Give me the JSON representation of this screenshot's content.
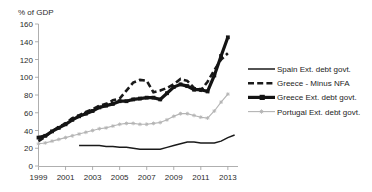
{
  "chart_data": {
    "type": "line",
    "title": "",
    "ylabel": "% of GDP",
    "xlabel": "",
    "ylim": [
      0,
      160
    ],
    "ytick_step": 20,
    "yticks": [
      0,
      20,
      40,
      60,
      80,
      100,
      120,
      140,
      160
    ],
    "xlim": [
      1999,
      2013.75
    ],
    "xticks": [
      1999,
      2001,
      2003,
      2005,
      2007,
      2009,
      2011,
      2013
    ],
    "xtick_labels": [
      "1999",
      "2001",
      "2003",
      "2005",
      "2007",
      "2009",
      "2011",
      "2013"
    ],
    "grid": false,
    "legend_position": "right",
    "series": [
      {
        "name": "Spain Ext. debt govt.",
        "key": "spain",
        "color": "#1a1a1a",
        "style": "solid-thin",
        "marker": "none",
        "x": [
          2002.0,
          2002.5,
          2003.0,
          2003.5,
          2004.0,
          2004.5,
          2005.0,
          2005.5,
          2006.0,
          2006.5,
          2007.0,
          2007.5,
          2008.0,
          2008.5,
          2009.0,
          2009.5,
          2010.0,
          2010.5,
          2011.0,
          2011.5,
          2012.0,
          2012.5,
          2013.0,
          2013.5
        ],
        "values": [
          23,
          23,
          23,
          23,
          22,
          22,
          21,
          21,
          20,
          19,
          19,
          19,
          19,
          21,
          23,
          25,
          27,
          27,
          26,
          26,
          26,
          28,
          32,
          35
        ]
      },
      {
        "name": "Greece - Minus NFA",
        "key": "greece_nfa",
        "color": "#1a1a1a",
        "style": "dashed-thick",
        "marker": "none",
        "x": [
          1999.0,
          1999.5,
          2000.0,
          2000.5,
          2001.0,
          2001.5,
          2002.0,
          2002.5,
          2003.0,
          2003.5,
          2004.0,
          2004.5,
          2005.0,
          2005.5,
          2006.0,
          2006.5,
          2007.0,
          2007.5,
          2008.0,
          2008.5,
          2009.0,
          2009.5,
          2010.0,
          2010.5,
          2011.0,
          2011.5,
          2012.0,
          2012.5,
          2013.0
        ],
        "values": [
          28,
          33,
          39,
          44,
          48,
          54,
          57,
          61,
          64,
          68,
          70,
          74,
          76,
          85,
          94,
          97,
          96,
          83,
          85,
          88,
          92,
          98,
          96,
          88,
          85,
          95,
          108,
          120,
          127
        ]
      },
      {
        "name": "Greece Ext. debt govt.",
        "key": "greece_ext",
        "color": "#141414",
        "style": "solid-thick",
        "marker": "square",
        "x": [
          1999.0,
          1999.5,
          2000.0,
          2000.5,
          2001.0,
          2001.5,
          2002.0,
          2002.5,
          2003.0,
          2003.5,
          2004.0,
          2004.5,
          2005.0,
          2005.5,
          2006.0,
          2006.5,
          2007.0,
          2007.5,
          2008.0,
          2008.5,
          2009.0,
          2009.5,
          2010.0,
          2010.5,
          2011.0,
          2011.5,
          2012.0,
          2012.5,
          2013.0
        ],
        "values": [
          32,
          34,
          39,
          43,
          47,
          52,
          56,
          59,
          62,
          66,
          68,
          70,
          73,
          73,
          75,
          76,
          77,
          77,
          75,
          82,
          89,
          92,
          90,
          86,
          86,
          84,
          102,
          124,
          145
        ]
      },
      {
        "name": "Portugal Ext. debt govt.",
        "key": "portugal",
        "color": "#b4b4b4",
        "style": "solid-light",
        "marker": "star",
        "x": [
          1999.0,
          1999.5,
          2000.0,
          2000.5,
          2001.0,
          2001.5,
          2002.0,
          2002.5,
          2003.0,
          2003.5,
          2004.0,
          2004.5,
          2005.0,
          2005.5,
          2006.0,
          2006.5,
          2007.0,
          2007.5,
          2008.0,
          2008.5,
          2009.0,
          2009.5,
          2010.0,
          2010.5,
          2011.0,
          2011.5,
          2012.0,
          2012.5,
          2013.0
        ],
        "values": [
          25,
          26,
          28,
          30,
          32,
          34,
          36,
          38,
          40,
          42,
          43,
          45,
          47,
          48,
          48,
          47,
          47,
          48,
          49,
          52,
          56,
          59,
          59,
          57,
          55,
          54,
          62,
          72,
          81
        ]
      }
    ],
    "legend_entries": [
      {
        "label": "Spain Ext. debt govt.",
        "key": "spain"
      },
      {
        "label": "Greece - Minus NFA",
        "key": "greece_nfa"
      },
      {
        "label": "Greece Ext. debt govt.",
        "key": "greece_ext"
      },
      {
        "label": "Portugal Ext. debt govt.",
        "key": "portugal"
      }
    ]
  }
}
